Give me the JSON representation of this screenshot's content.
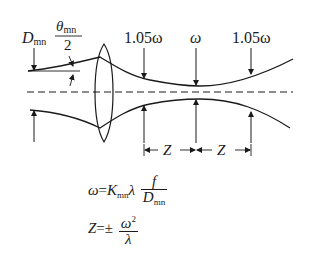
{
  "diagram": {
    "type": "gaussian-beam-focusing",
    "labels": {
      "aperture": "D",
      "aperture_sub": "mn",
      "half_angle_num": "θ",
      "half_angle_num_sub": "mn",
      "half_angle_den": "2",
      "left_spot": "1.05ω",
      "waist": "ω",
      "right_spot": "1.05ω",
      "z_left": "Z",
      "z_right": "Z"
    },
    "formulas": {
      "waist": {
        "lhs": "ω",
        "eq": "=",
        "k": "K",
        "k_sub": "mn",
        "lambda": "λ",
        "num": "f",
        "den": "D",
        "den_sub": "mn"
      },
      "depth": {
        "lhs": "Z",
        "eq": "=",
        "pm": "±",
        "num": "ω",
        "num_sup": "2",
        "den": "λ"
      }
    },
    "colors": {
      "ink": "#1a1a1a",
      "background": "#ffffff"
    }
  }
}
